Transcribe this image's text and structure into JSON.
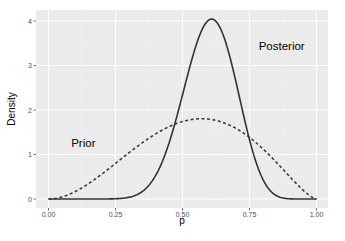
{
  "chart_data": {
    "type": "line",
    "title": "",
    "xlabel": "p",
    "ylabel": "Density",
    "xlim": [
      0,
      1
    ],
    "ylim": [
      0,
      4.1
    ],
    "grid": true,
    "legend": null,
    "x_ticks": [
      0.0,
      0.25,
      0.5,
      0.75,
      1.0
    ],
    "x_tick_labels": [
      "0.00",
      "0.25",
      "0.50",
      "0.75",
      "1.00"
    ],
    "y_ticks": [
      0,
      1,
      2,
      3,
      4
    ],
    "y_tick_labels": [
      "0",
      "1",
      "2",
      "3",
      "4"
    ],
    "series": [
      {
        "name": "Prior",
        "style": "dashed",
        "distribution": "beta",
        "alpha": 3,
        "beta": 2.5,
        "peak_x": 0.57,
        "peak_density": 1.8,
        "x": [
          0.0,
          0.1,
          0.2,
          0.3,
          0.4,
          0.5,
          0.6,
          0.7,
          0.8,
          0.9,
          1.0
        ],
        "values": [
          0.0,
          0.06,
          0.36,
          0.81,
          1.28,
          1.64,
          1.8,
          1.69,
          1.3,
          0.69,
          0.0
        ]
      },
      {
        "name": "Posterior",
        "style": "solid",
        "distribution": "beta",
        "alpha": 15,
        "beta": 10,
        "peak_x": 0.61,
        "peak_density": 4.0,
        "x": [
          0.0,
          0.1,
          0.2,
          0.3,
          0.4,
          0.5,
          0.6,
          0.7,
          0.8,
          0.9,
          1.0
        ],
        "values": [
          0.0,
          0.0,
          0.0,
          0.02,
          0.35,
          2.1,
          4.0,
          2.97,
          0.58,
          0.02,
          0.0
        ]
      }
    ],
    "annotations": [
      {
        "text": "Prior",
        "x": 0.13,
        "y": 1.17
      },
      {
        "text": "Posterior",
        "x": 0.87,
        "y": 3.35
      }
    ]
  },
  "colors": {
    "panel_bg": "#ebebeb",
    "grid_major": "#ffffff",
    "grid_minor": "#f5f5f5",
    "line": "#333333",
    "tick_text": "#4d4d4d"
  }
}
